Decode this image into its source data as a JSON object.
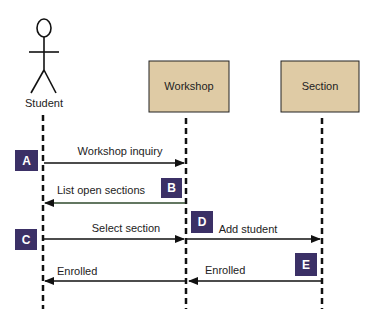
{
  "diagram": {
    "type": "sequence",
    "colors": {
      "box_fill": "#dfcba5",
      "box_stroke": "#222222",
      "badge_fill": "#3b3066",
      "line": "#111111",
      "green_line": "#2f4a2c"
    },
    "actors": [
      {
        "id": "student",
        "label": "Student",
        "kind": "stick-figure"
      },
      {
        "id": "workshop",
        "label": "Workshop",
        "kind": "object-box"
      },
      {
        "id": "section",
        "label": "Section",
        "kind": "object-box"
      }
    ],
    "messages": [
      {
        "badge": "A",
        "label": "Workshop inquiry",
        "from": "student",
        "to": "workshop"
      },
      {
        "badge": "B",
        "label": "List open sections",
        "from": "workshop",
        "to": "student"
      },
      {
        "badge": "C",
        "label": "Select section",
        "from": "student",
        "to": "workshop"
      },
      {
        "badge": "D",
        "label": "Add student",
        "from": "workshop",
        "to": "section"
      },
      {
        "badge": "E",
        "label": "Enrolled",
        "from": "section",
        "to": "workshop"
      },
      {
        "badge": "",
        "label": "Enrolled",
        "from": "workshop",
        "to": "student"
      }
    ]
  }
}
